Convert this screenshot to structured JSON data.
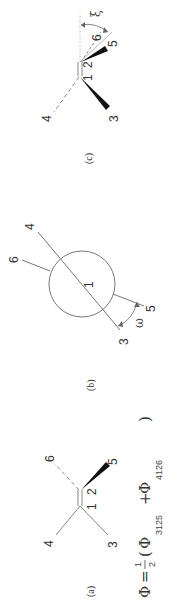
{
  "figure": {
    "panels": [
      {
        "id": "a",
        "label": "(a)",
        "atoms": [
          "1",
          "2",
          "3",
          "4",
          "5",
          "6"
        ]
      },
      {
        "id": "b",
        "label": "(b)",
        "atoms": [
          "1",
          "3",
          "4",
          "5",
          "6"
        ],
        "angle": "ω"
      },
      {
        "id": "c",
        "label": "(c)",
        "atoms": [
          "1",
          "2",
          "3",
          "4",
          "5",
          "6"
        ],
        "angle": "ξ"
      }
    ],
    "formula": {
      "lhs": "Φ",
      "eq": "=",
      "frac_num": "1",
      "frac_den": "2",
      "open": "(",
      "term1": "Φ",
      "term1_sub": "3125",
      "plus": "+",
      "term2": "Φ",
      "term2_sub": "4126",
      "close": ")"
    }
  },
  "colors": {
    "line": "#888888",
    "bold": "#111111",
    "text": "#333333"
  }
}
